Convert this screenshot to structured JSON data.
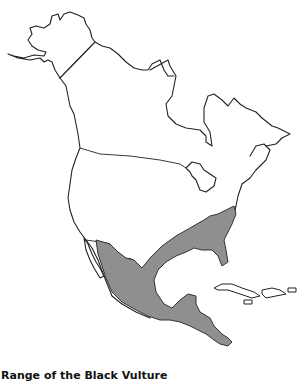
{
  "map": {
    "title": "Range of the Black Vulture",
    "region": "North America",
    "range_color": "#8f8f8f",
    "outline_color": "#222222",
    "shaded_areas": [
      "Southeastern United States",
      "Mexico",
      "Central America"
    ]
  },
  "caption": {
    "text": "Range of the Black Vulture"
  }
}
